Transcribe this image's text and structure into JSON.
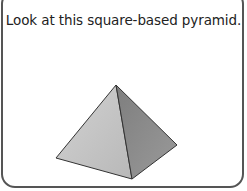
{
  "prompt": {
    "text": "Look at this square-based pyramid."
  },
  "figure": {
    "name": "square-based pyramid",
    "colors": {
      "left_face": "#c4c4c4",
      "right_face": "#8f8f8f",
      "edge": "#333333",
      "border": "#555555"
    }
  }
}
